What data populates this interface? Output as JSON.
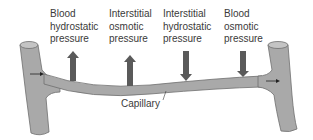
{
  "labels": [
    {
      "lines": [
        "Blood",
        "hydrostatic",
        "pressure"
      ],
      "direction": "up"
    },
    {
      "lines": [
        "Interstitial",
        "osmotic",
        "pressure"
      ],
      "direction": "up"
    },
    {
      "lines": [
        "Interstitial",
        "hydrostatic",
        "pressure"
      ],
      "direction": "down"
    },
    {
      "lines": [
        "Blood",
        "osmotic",
        "pressure"
      ],
      "direction": "down"
    }
  ],
  "capillary_label": "Capillary",
  "colors": {
    "vessel_fill": "#a9a9a9",
    "vessel_stroke": "#6e6e6e",
    "arrow": "#5a5a5a",
    "text": "#3a3a3a"
  }
}
